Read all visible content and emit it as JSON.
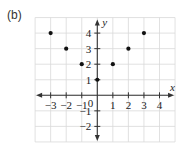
{
  "panel_label": "(b)",
  "chart_data": {
    "type": "scatter",
    "title": "",
    "xlabel": "x",
    "ylabel": "y",
    "xlim": [
      -4,
      5
    ],
    "ylim": [
      -3,
      5
    ],
    "grid": true,
    "legend": null,
    "x_ticks": [
      -3,
      -2,
      -1,
      1,
      2,
      3,
      4
    ],
    "x_tick_labels": [
      "−3",
      "−2",
      "−1",
      "1",
      "2",
      "3",
      "4"
    ],
    "y_ticks": [
      4,
      3,
      2,
      1,
      -1,
      -2
    ],
    "y_tick_labels": [
      "4",
      "3",
      "2",
      "1",
      "−1",
      "−2"
    ],
    "origin_label": "0",
    "series": [
      {
        "name": "points",
        "x": [
          -3,
          -2,
          -1,
          0,
          1,
          2,
          3
        ],
        "y": [
          4,
          3,
          2,
          1,
          2,
          3,
          4
        ]
      }
    ],
    "colors": {
      "grid": "#d9d9d9",
      "axis": "#333333",
      "point": "#111111",
      "text": "#222222"
    }
  }
}
